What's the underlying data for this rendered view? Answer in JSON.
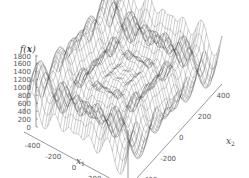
{
  "chart_data": {
    "type": "surface3d",
    "title": "",
    "zlabel": "f(x)",
    "xlabel": "x1",
    "ylabel": "x2",
    "z_ticks": [
      "0",
      "200",
      "400",
      "600",
      "800",
      "1000",
      "1200",
      "1400",
      "1600",
      "1800"
    ],
    "x1_ticks": [
      "-400",
      "-200",
      "0",
      "200",
      "400"
    ],
    "x2_ticks": [
      "-400",
      "-200",
      "0",
      "200",
      "400"
    ],
    "x1_range": [
      -500,
      500
    ],
    "x2_range": [
      -500,
      500
    ],
    "zlim": [
      0,
      1800
    ],
    "function": "Schwefel: 418.9829*2 - sum(x_i*sin(sqrt(|x_i|)))",
    "grid_resolution": 40,
    "render": "wireframe",
    "line_color": "#555555"
  },
  "labels": {
    "zlabel_main": "f(",
    "zlabel_bold": "x",
    "zlabel_end": ")",
    "x1_main": "x",
    "x1_sub": "1",
    "x2_main": "x",
    "x2_sub": "2"
  }
}
